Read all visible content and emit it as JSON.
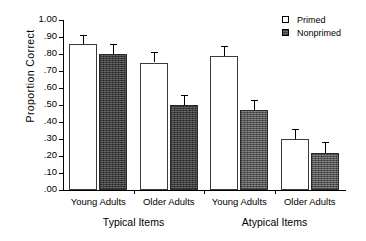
{
  "chart_data": {
    "type": "bar",
    "title": "",
    "xlabel": "",
    "ylabel": "Proportion  Correct",
    "ylim": [
      0.0,
      1.0
    ],
    "ytick_labels": [
      ".00",
      ".10",
      ".20",
      ".30",
      ".40",
      ".50",
      ".60",
      ".70",
      ".80",
      ".90",
      "1.00"
    ],
    "ytick_values": [
      0.0,
      0.1,
      0.2,
      0.3,
      0.4,
      0.5,
      0.6,
      0.7,
      0.8,
      0.9,
      1.0
    ],
    "grid": false,
    "legend_position": "top-right",
    "categories": [
      "Young Adults",
      "Older Adults",
      "Young Adults",
      "Older Adults"
    ],
    "supergroups": [
      {
        "label": "Typical Items",
        "categories": [
          "Young Adults",
          "Older Adults"
        ]
      },
      {
        "label": "Atypical Items",
        "categories": [
          "Young Adults",
          "Older Adults"
        ]
      }
    ],
    "series": [
      {
        "name": "Primed",
        "values": [
          0.86,
          0.75,
          0.79,
          0.3
        ],
        "errors": [
          0.05,
          0.06,
          0.06,
          0.06
        ]
      },
      {
        "name": "Nonprimed",
        "values": [
          0.8,
          0.5,
          0.47,
          0.22
        ],
        "errors": [
          0.06,
          0.06,
          0.06,
          0.06
        ]
      }
    ],
    "bars": [
      {
        "group": "Typical Items",
        "category": "Young Adults",
        "series": "Primed",
        "value": 0.86,
        "error": 0.05
      },
      {
        "group": "Typical Items",
        "category": "Young Adults",
        "series": "Nonprimed",
        "value": 0.8,
        "error": 0.06
      },
      {
        "group": "Typical Items",
        "category": "Older Adults",
        "series": "Primed",
        "value": 0.75,
        "error": 0.06
      },
      {
        "group": "Typical Items",
        "category": "Older Adults",
        "series": "Nonprimed",
        "value": 0.5,
        "error": 0.06
      },
      {
        "group": "Atypical Items",
        "category": "Young Adults",
        "series": "Primed",
        "value": 0.79,
        "error": 0.06
      },
      {
        "group": "Atypical Items",
        "category": "Young Adults",
        "series": "Nonprimed",
        "value": 0.47,
        "error": 0.06
      },
      {
        "group": "Atypical Items",
        "category": "Older Adults",
        "series": "Primed",
        "value": 0.3,
        "error": 0.06
      },
      {
        "group": "Atypical Items",
        "category": "Older Adults",
        "series": "Nonprimed",
        "value": 0.22,
        "error": 0.06
      }
    ]
  },
  "legend": {
    "items": [
      {
        "label": "Primed",
        "swatch": "open-square-icon"
      },
      {
        "label": "Nonprimed",
        "swatch": "filled-square-icon"
      }
    ]
  },
  "axis": {
    "y_title": "Proportion  Correct"
  },
  "labels": {
    "cond": [
      "Young Adults",
      "Older Adults",
      "Young Adults",
      "Older Adults"
    ],
    "super": [
      "Typical Items",
      "Atypical Items"
    ]
  },
  "colors": {
    "primed_fill": "#ffffff",
    "nonprimed_fill": "#5a5a5a",
    "axis": "#000000",
    "background": "#ffffff"
  }
}
